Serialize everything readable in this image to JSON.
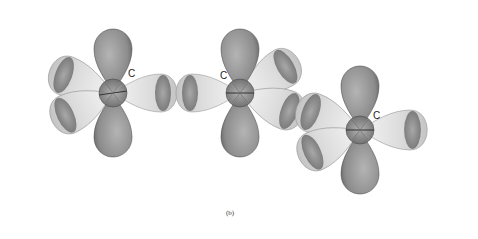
{
  "figure": {
    "caption": "(b)",
    "colors": {
      "p_orbital": "#8a8a8a",
      "hybrid_lobe": "#e6e6e6",
      "lobe_edge": "#555555",
      "background": "#ffffff"
    },
    "atoms": [
      {
        "label": "C",
        "cx": 113,
        "cy": 93
      },
      {
        "label": "C",
        "cx": 240,
        "cy": 93
      },
      {
        "label": "C",
        "cx": 360,
        "cy": 130
      }
    ]
  }
}
